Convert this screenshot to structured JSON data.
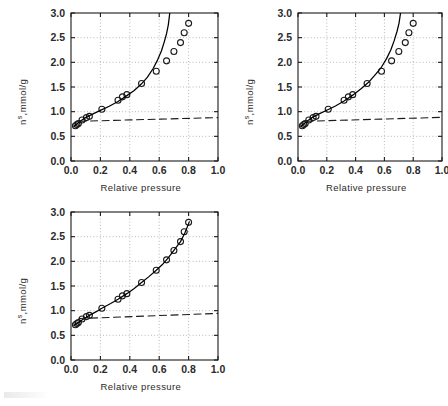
{
  "figure": {
    "background": "#ffffff",
    "axis_color": "#1a1a1a",
    "grid_color": "#9a9a9a",
    "marker_color": "#1a1a1a",
    "curve_color": "#000000",
    "dashed_color": "#1a1a1a"
  },
  "axes": {
    "xlabel": "Relative pressure",
    "ylabel_main": "n",
    "ylabel_sup": "s",
    "ylabel_rest": ",mmol/g",
    "xticks": [
      "0.0",
      "0.2",
      "0.4",
      "0.6",
      "0.8",
      "1.0"
    ],
    "xtick_values": [
      0.0,
      0.2,
      0.4,
      0.6,
      0.8,
      1.0
    ],
    "yticks": [
      "0.0",
      "0.5",
      "1.0",
      "1.5",
      "2.0",
      "2.5",
      "3.0"
    ],
    "ytick_values": [
      0.0,
      0.5,
      1.0,
      1.5,
      2.0,
      2.5,
      3.0
    ],
    "xlim": [
      0.0,
      1.0
    ],
    "ylim": [
      0.0,
      3.0
    ],
    "grid": "dotted-major"
  },
  "chart_data": [
    {
      "type": "scatter",
      "name": "panel-top-left",
      "title": "",
      "xlabel": "Relative pressure",
      "ylabel": "n s ,mmol/g",
      "xlim": [
        0.0,
        1.0
      ],
      "ylim": [
        0.0,
        3.0
      ],
      "grid": true,
      "legend": "none",
      "series": [
        {
          "name": "experimental points",
          "style": "open-circle",
          "x": [
            0.03,
            0.04,
            0.05,
            0.075,
            0.105,
            0.125,
            0.21,
            0.32,
            0.35,
            0.38,
            0.48,
            0.58,
            0.65,
            0.7,
            0.745,
            0.77,
            0.8
          ],
          "y": [
            0.715,
            0.74,
            0.76,
            0.83,
            0.88,
            0.905,
            1.05,
            1.23,
            1.3,
            1.345,
            1.57,
            1.82,
            2.03,
            2.22,
            2.4,
            2.6,
            2.79
          ]
        },
        {
          "name": "fitted model curve",
          "style": "solid-line",
          "x": [
            0.02,
            0.06,
            0.1,
            0.15,
            0.2,
            0.26,
            0.32,
            0.38,
            0.43,
            0.48,
            0.52,
            0.56,
            0.59,
            0.615,
            0.635,
            0.65,
            0.662,
            0.672
          ],
          "y": [
            0.7,
            0.8,
            0.88,
            0.955,
            1.025,
            1.11,
            1.205,
            1.325,
            1.43,
            1.565,
            1.7,
            1.88,
            2.055,
            2.23,
            2.42,
            2.58,
            2.76,
            3.0
          ]
        },
        {
          "name": "monolayer capacity line",
          "style": "dashed-line",
          "x": [
            0.055,
            1.0
          ],
          "y": [
            0.805,
            0.88
          ]
        }
      ]
    },
    {
      "type": "scatter",
      "name": "panel-top-right",
      "title": "",
      "xlabel": "Relative pressure",
      "ylabel": "n s ,mmol/g",
      "xlim": [
        0.0,
        1.0
      ],
      "ylim": [
        0.0,
        3.0
      ],
      "grid": true,
      "legend": "none",
      "series": [
        {
          "name": "experimental points",
          "style": "open-circle",
          "x": [
            0.03,
            0.04,
            0.05,
            0.075,
            0.105,
            0.125,
            0.21,
            0.32,
            0.35,
            0.38,
            0.48,
            0.58,
            0.65,
            0.7,
            0.745,
            0.77,
            0.8
          ],
          "y": [
            0.715,
            0.74,
            0.76,
            0.83,
            0.88,
            0.905,
            1.05,
            1.23,
            1.3,
            1.345,
            1.57,
            1.82,
            2.03,
            2.22,
            2.4,
            2.6,
            2.79
          ]
        },
        {
          "name": "fitted model curve",
          "style": "solid-line",
          "x": [
            0.02,
            0.06,
            0.1,
            0.15,
            0.2,
            0.26,
            0.32,
            0.38,
            0.44,
            0.49,
            0.54,
            0.58,
            0.615,
            0.645,
            0.668,
            0.688,
            0.702,
            0.712
          ],
          "y": [
            0.7,
            0.8,
            0.885,
            0.96,
            1.03,
            1.115,
            1.215,
            1.335,
            1.47,
            1.595,
            1.76,
            1.905,
            2.075,
            2.255,
            2.44,
            2.63,
            2.8,
            3.0
          ]
        },
        {
          "name": "monolayer capacity line",
          "style": "dashed-line",
          "x": [
            0.055,
            1.0
          ],
          "y": [
            0.805,
            0.885
          ]
        }
      ]
    },
    {
      "type": "scatter",
      "name": "panel-bottom",
      "title": "",
      "xlabel": "Relative pressure",
      "ylabel": "n s ,mmol/g",
      "xlim": [
        0.0,
        1.0
      ],
      "ylim": [
        0.0,
        3.0
      ],
      "grid": true,
      "legend": "none",
      "series": [
        {
          "name": "experimental points",
          "style": "open-circle",
          "x": [
            0.03,
            0.04,
            0.05,
            0.075,
            0.105,
            0.125,
            0.21,
            0.32,
            0.35,
            0.38,
            0.48,
            0.58,
            0.65,
            0.7,
            0.745,
            0.77,
            0.8
          ],
          "y": [
            0.715,
            0.74,
            0.76,
            0.83,
            0.88,
            0.905,
            1.05,
            1.23,
            1.3,
            1.345,
            1.57,
            1.82,
            2.03,
            2.22,
            2.4,
            2.6,
            2.79
          ]
        },
        {
          "name": "fitted model curve",
          "style": "solid-line",
          "x": [
            0.02,
            0.05,
            0.08,
            0.125,
            0.175,
            0.21,
            0.27,
            0.32,
            0.38,
            0.43,
            0.48,
            0.53,
            0.58,
            0.62,
            0.66,
            0.7,
            0.745,
            0.775,
            0.805
          ],
          "y": [
            0.7,
            0.76,
            0.82,
            0.905,
            0.985,
            1.05,
            1.145,
            1.23,
            1.345,
            1.45,
            1.57,
            1.69,
            1.82,
            1.93,
            2.065,
            2.22,
            2.4,
            2.58,
            2.8
          ]
        },
        {
          "name": "monolayer capacity line",
          "style": "dashed-line",
          "x": [
            0.055,
            1.0
          ],
          "y": [
            0.84,
            0.945
          ]
        }
      ]
    }
  ]
}
